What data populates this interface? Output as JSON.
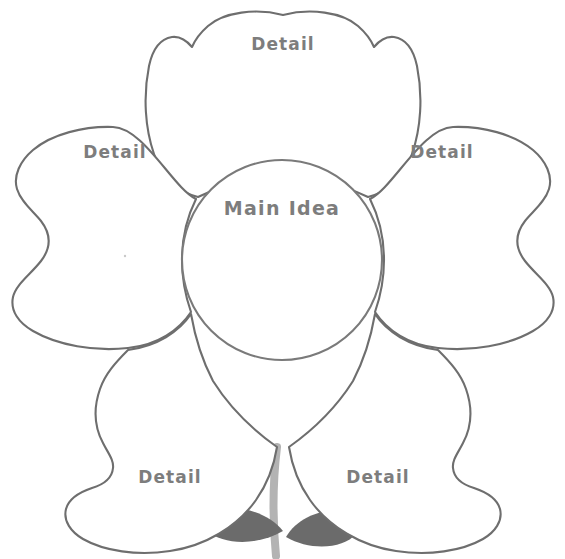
{
  "page": {
    "background_color": "#ffffff"
  },
  "diagram": {
    "type": "flower-graphic-organizer",
    "outline_color": "#6e6e6e",
    "text_color": "#7d7d7d",
    "stem_color": "#b3b3b3",
    "leaf_color": "#6b6b6b",
    "petal_fill": "#ffffff",
    "petal_count": 5
  },
  "center": {
    "label": "Main Idea",
    "x": 282,
    "y": 208,
    "circle_center_x": 282,
    "circle_center_y": 260,
    "circle_radius": 100
  },
  "petals": [
    {
      "id": "petal-top",
      "label": "Detail",
      "label_x": 283,
      "label_y": 44,
      "position": "top"
    },
    {
      "id": "petal-left",
      "label": "Detail",
      "label_x": 115,
      "label_y": 152,
      "position": "upper-left"
    },
    {
      "id": "petal-right",
      "label": "Detail",
      "label_x": 442,
      "label_y": 152,
      "position": "upper-right"
    },
    {
      "id": "petal-bottom-left",
      "label": "Detail",
      "label_x": 170,
      "label_y": 477,
      "position": "lower-left"
    },
    {
      "id": "petal-bottom-right",
      "label": "Detail",
      "label_x": 378,
      "label_y": 477,
      "position": "lower-right"
    }
  ],
  "stem": {
    "name": "stem",
    "leaf_left": "leaf",
    "leaf_right": "leaf"
  }
}
